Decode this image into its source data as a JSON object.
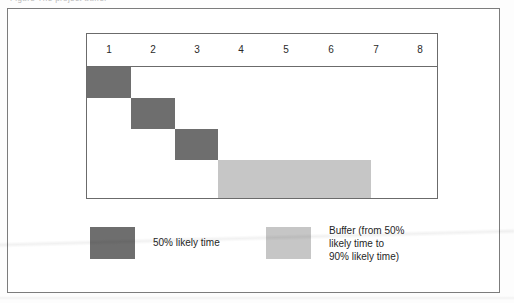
{
  "figure": {
    "caption_sliver": "Figure  The project buffer"
  },
  "chart_data": {
    "type": "bar",
    "orientation": "horizontal",
    "title": "",
    "xlabel": "",
    "ylabel": "",
    "axis_tick_labels": [
      "1",
      "2",
      "3",
      "4",
      "5",
      "6",
      "7",
      "8"
    ],
    "xlim": [
      0,
      8
    ],
    "grid": false,
    "legend_position": "bottom",
    "bars": [
      {
        "name": "task-1",
        "series": "50% likely time",
        "row": 1,
        "start": 0,
        "end": 1,
        "color": "#6e6e6e"
      },
      {
        "name": "task-2",
        "series": "50% likely time",
        "row": 2,
        "start": 1,
        "end": 2,
        "color": "#6e6e6e"
      },
      {
        "name": "task-3",
        "series": "50% likely time",
        "row": 3,
        "start": 2,
        "end": 3,
        "color": "#6e6e6e"
      },
      {
        "name": "project-buffer",
        "series": "Buffer (from 50% likely time to 90% likely time)",
        "row": 4,
        "start": 3,
        "end": 6.5,
        "color": "#c6c6c6"
      }
    ],
    "series": [
      {
        "name": "50% likely time",
        "color": "#6e6e6e",
        "values": [
          1,
          1,
          1,
          0
        ]
      },
      {
        "name": "Buffer (from 50% likely time to 90% likely time)",
        "color": "#c6c6c6",
        "values": [
          0,
          0,
          0,
          3.5
        ]
      }
    ]
  },
  "legend": {
    "entries": [
      {
        "label": "50% likely time",
        "color": "#6e6e6e"
      },
      {
        "label": "Buffer (from 50%\nlikely time to\n90% likely time)",
        "color": "#c6c6c6"
      }
    ]
  },
  "colors": {
    "task": "#6e6e6e",
    "buffer": "#c6c6c6",
    "frame": "#7c7c7c",
    "chart_frame": "#6b6b6b",
    "text": "#1f1f1f",
    "page": "#ffffff"
  }
}
